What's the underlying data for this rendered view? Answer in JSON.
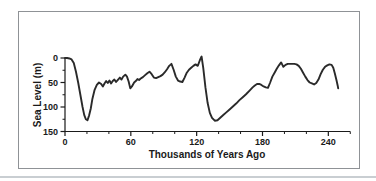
{
  "chart_data": {
    "type": "line",
    "title": "",
    "xlabel": "Thousands of Years Ago",
    "ylabel": "Sea Level (m)",
    "x_range": [
      0,
      260
    ],
    "y_range": [
      0,
      150
    ],
    "y_axis_orientation": "inverted (0 at top, 150 at bottom; values are meters below present sea level)",
    "x_major_ticks": [
      0,
      60,
      120,
      180,
      240
    ],
    "x_minor_ticks": [
      20,
      40,
      80,
      100,
      140,
      160,
      200,
      220,
      260
    ],
    "y_major_ticks": [
      0,
      50,
      100,
      150
    ],
    "y_minor_ticks": [
      25,
      75,
      125
    ],
    "grid": "off",
    "legend": "none",
    "series": [
      {
        "name": "sea-level-curve",
        "points": [
          [
            0,
            0
          ],
          [
            2,
            0
          ],
          [
            4,
            1
          ],
          [
            6,
            3
          ],
          [
            8,
            10
          ],
          [
            10,
            28
          ],
          [
            12,
            50
          ],
          [
            14,
            75
          ],
          [
            16,
            100
          ],
          [
            17.5,
            116
          ],
          [
            19,
            125
          ],
          [
            20.5,
            127
          ],
          [
            22,
            117
          ],
          [
            23.5,
            103
          ],
          [
            25,
            83
          ],
          [
            27,
            65
          ],
          [
            29,
            55
          ],
          [
            31,
            50
          ],
          [
            33,
            53
          ],
          [
            34.5,
            58
          ],
          [
            36,
            52
          ],
          [
            37.5,
            47
          ],
          [
            39,
            51
          ],
          [
            40.5,
            46
          ],
          [
            42,
            52
          ],
          [
            43.5,
            47
          ],
          [
            45,
            44
          ],
          [
            46.5,
            49
          ],
          [
            48,
            45
          ],
          [
            50,
            40
          ],
          [
            51.5,
            44
          ],
          [
            53,
            38
          ],
          [
            55,
            34
          ],
          [
            56.5,
            38
          ],
          [
            58,
            48
          ],
          [
            59.5,
            62
          ],
          [
            61,
            58
          ],
          [
            63,
            50
          ],
          [
            64.5,
            47
          ],
          [
            66,
            43
          ],
          [
            67.5,
            45
          ],
          [
            69,
            42
          ],
          [
            71,
            39
          ],
          [
            73,
            35
          ],
          [
            75,
            31
          ],
          [
            77,
            28
          ],
          [
            79,
            33
          ],
          [
            81,
            40
          ],
          [
            83,
            41
          ],
          [
            85,
            39
          ],
          [
            87,
            37
          ],
          [
            89,
            34
          ],
          [
            91,
            29
          ],
          [
            93,
            23
          ],
          [
            95,
            16
          ],
          [
            97,
            12
          ],
          [
            99,
            24
          ],
          [
            101,
            38
          ],
          [
            103,
            46
          ],
          [
            105,
            48
          ],
          [
            107,
            49
          ],
          [
            109,
            40
          ],
          [
            111,
            30
          ],
          [
            113,
            24
          ],
          [
            115,
            20
          ],
          [
            117,
            16
          ],
          [
            119,
            13
          ],
          [
            121,
            16
          ],
          [
            123,
            4
          ],
          [
            124.5,
            -3
          ],
          [
            126,
            20
          ],
          [
            128,
            60
          ],
          [
            130,
            92
          ],
          [
            132,
            112
          ],
          [
            134,
            122
          ],
          [
            136.5,
            128
          ],
          [
            139,
            127
          ],
          [
            141,
            123
          ],
          [
            144,
            117
          ],
          [
            147,
            111
          ],
          [
            150,
            105
          ],
          [
            153,
            99
          ],
          [
            156,
            93
          ],
          [
            159,
            86
          ],
          [
            162,
            80
          ],
          [
            165,
            74
          ],
          [
            168,
            67
          ],
          [
            171,
            60
          ],
          [
            173,
            56
          ],
          [
            175,
            53
          ],
          [
            177,
            53
          ],
          [
            179,
            55
          ],
          [
            181,
            58
          ],
          [
            183,
            60
          ],
          [
            185,
            61
          ],
          [
            187,
            50
          ],
          [
            189,
            38
          ],
          [
            191,
            30
          ],
          [
            193,
            22
          ],
          [
            195,
            15
          ],
          [
            197,
            9
          ],
          [
            199,
            18
          ],
          [
            201,
            14
          ],
          [
            203,
            12
          ],
          [
            205,
            12
          ],
          [
            207,
            12
          ],
          [
            209,
            12
          ],
          [
            211,
            13
          ],
          [
            213,
            16
          ],
          [
            215,
            22
          ],
          [
            217,
            30
          ],
          [
            219,
            38
          ],
          [
            221,
            45
          ],
          [
            223,
            50
          ],
          [
            225,
            52
          ],
          [
            227,
            54
          ],
          [
            229,
            51
          ],
          [
            231,
            44
          ],
          [
            233,
            33
          ],
          [
            235,
            24
          ],
          [
            237,
            18
          ],
          [
            239,
            15
          ],
          [
            241,
            13
          ],
          [
            243,
            14
          ],
          [
            244.5,
            20
          ],
          [
            246,
            32
          ],
          [
            247.5,
            46
          ],
          [
            248.5,
            56
          ],
          [
            249,
            62
          ]
        ]
      }
    ],
    "colors": {
      "line": "#2a2a2a",
      "axis": "#1a1a1a",
      "text": "#1a1a1a",
      "frame_border": "#8f9296",
      "divider": "#c9ced2",
      "background": "#ffffff"
    }
  }
}
